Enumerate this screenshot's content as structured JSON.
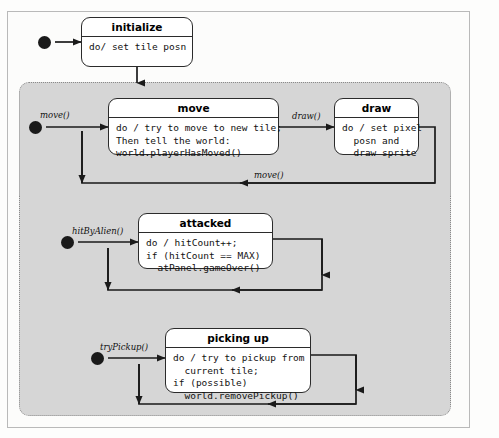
{
  "diagram": {
    "type": "uml-state-machine",
    "title_visible": false,
    "colors": {
      "page_background": "#fdfdfc",
      "outer_frame_border": "#b9b9b9",
      "panel_fill": "#d6d6d6",
      "panel_border": "#8a8a8a",
      "state_fill": "#ffffff",
      "state_border": "#2b2b2b",
      "wire": "#1a1a1a",
      "text": "#111111"
    },
    "states": [
      {
        "id": "initialize",
        "title": "initialize",
        "body": "do/ set tile posn",
        "align": "center"
      },
      {
        "id": "move",
        "title": "move",
        "body": "do / try to move to new tile;\nThen tell the world:\nworld.playerHasMoved()",
        "align": "left"
      },
      {
        "id": "draw",
        "title": "draw",
        "body": "do / set pixel\n  posn and\n  draw sprite",
        "align": "left"
      },
      {
        "id": "attacked",
        "title": "attacked",
        "body": "do / hitCount++;\nif (hitCount == MAX)\n  atPanel.gameOver()",
        "align": "left"
      },
      {
        "id": "picking-up",
        "title": "picking up",
        "body": "do / try to pickup from\n  current tile;\nif (possible)\n  world.removePickup()",
        "align": "left"
      }
    ],
    "transitions": [
      {
        "id": "t-move-in",
        "label": "move()"
      },
      {
        "id": "t-draw",
        "label": "draw()"
      },
      {
        "id": "t-move-loop",
        "label": "move()"
      },
      {
        "id": "t-hitbyalien",
        "label": "hitByAlien()"
      },
      {
        "id": "t-trypickup",
        "label": "tryPickup()"
      }
    ],
    "panels": [
      {
        "id": "panel-move",
        "contains": [
          "move",
          "draw"
        ]
      },
      {
        "id": "panel-attacked",
        "contains": [
          "attacked"
        ]
      },
      {
        "id": "panel-pickup",
        "contains": [
          "picking-up"
        ]
      }
    ]
  }
}
